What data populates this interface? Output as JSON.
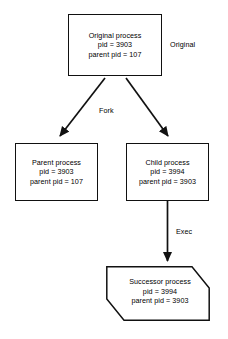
{
  "diagram": {
    "background_color": "#ffffff",
    "stroke_color": "#111111",
    "text_color": "#000000",
    "nodes": [
      {
        "id": "original",
        "shape": "rectangle",
        "lines": [
          "Original process",
          "pid = 3903",
          "parent pid = 107"
        ],
        "pid": "3903",
        "parent_pid": "107"
      },
      {
        "id": "parent",
        "shape": "rectangle",
        "lines": [
          "Parent process",
          "pid = 3903",
          "parent pid = 107"
        ],
        "pid": "3903",
        "parent_pid": "107"
      },
      {
        "id": "child",
        "shape": "rectangle",
        "lines": [
          "Child process",
          "pid = 3994",
          "parent pid = 3903"
        ],
        "pid": "3994",
        "parent_pid": "3903"
      },
      {
        "id": "successor",
        "shape": "cut-corner-polygon",
        "lines": [
          "Successor process",
          "pid = 3994",
          "parent pid = 3903"
        ],
        "pid": "3994",
        "parent_pid": "3903"
      }
    ],
    "labels": {
      "original": "Original",
      "fork": "Fork",
      "exec": "Exec"
    }
  }
}
